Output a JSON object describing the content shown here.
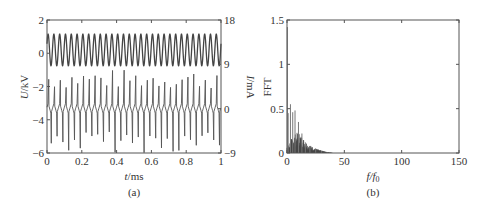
{
  "chart_data": [
    {
      "id": "a",
      "type": "line",
      "caption": "(a)",
      "title": "",
      "xlabel": "t/ms",
      "xlabel_italic": "t",
      "xlabel_unit": "/ms",
      "ylabel_left": "U/kV",
      "ylabel_left_italic": "U",
      "ylabel_left_unit": "/kV",
      "ylabel_right": "I/mA",
      "ylabel_right_italic": "I",
      "ylabel_right_unit": "/mA",
      "xlim": [
        0,
        1
      ],
      "ylim_left": [
        -6,
        2
      ],
      "ylim_right": [
        -9,
        18
      ],
      "xticks": [
        0,
        0.2,
        0.4,
        0.6,
        0.8,
        1
      ],
      "xtick_labels": [
        "0",
        "0.2",
        "0.4",
        "0.6",
        "0.8",
        "1"
      ],
      "yticks_left": [
        -6,
        -4,
        -2,
        0,
        2
      ],
      "ytick_labels_left": [
        "−6",
        "−4",
        "−2",
        "0",
        "2"
      ],
      "yticks_right": [
        -9,
        0,
        9,
        18
      ],
      "ytick_labels_right": [
        "−9",
        "0",
        "9",
        "18"
      ],
      "grid": false,
      "legend": null,
      "series": [
        {
          "name": "Voltage U",
          "axis": "left",
          "kind": "sinusoid",
          "offset_kV": 0.2,
          "amplitude_kV": 0.95,
          "cycles": 30,
          "color": "#444444"
        },
        {
          "name": "Current I",
          "axis": "right",
          "kind": "pulse-train",
          "baseline_mA": 0,
          "ripple_mA": 1.0,
          "pulses_per_cycle": 1,
          "cycles": 30,
          "positive_peak_mA_range": [
            4,
            8
          ],
          "negative_peak_mA_range": [
            -4.5,
            -9
          ],
          "color": "#555555"
        }
      ]
    },
    {
      "id": "b",
      "type": "bar",
      "caption": "(b)",
      "title": "",
      "xlabel": "f/f0",
      "xlabel_italic": "f/f",
      "xlabel_sub": "0",
      "ylabel": "FFT",
      "xlim": [
        0,
        150
      ],
      "ylim": [
        0,
        1.5
      ],
      "xticks": [
        0,
        50,
        100,
        150
      ],
      "xtick_labels": [
        "0",
        "50",
        "100",
        "150"
      ],
      "yticks": [
        0,
        0.5,
        1,
        1.5
      ],
      "ytick_labels": [
        "0",
        "0.5",
        "1",
        "1.5"
      ],
      "grid": false,
      "legend": null,
      "dominant_peaks": [
        {
          "x": 0.3,
          "y": 1.42
        },
        {
          "x": 1,
          "y": 0.45
        },
        {
          "x": 3,
          "y": 0.55
        },
        {
          "x": 5,
          "y": 0.46
        },
        {
          "x": 7,
          "y": 0.48
        },
        {
          "x": 10,
          "y": 0.35
        },
        {
          "x": 13,
          "y": 0.22
        },
        {
          "x": 16,
          "y": 0.12
        },
        {
          "x": 20,
          "y": 0.08
        },
        {
          "x": 25,
          "y": 0.04
        },
        {
          "x": 30,
          "y": 0.02
        },
        {
          "x": 35,
          "y": 0.01
        }
      ],
      "envelope": {
        "description": "dense harmonic cluster decaying from ~0.2 at f/f0≈5-12 to ~0 by f/f0≈40",
        "points": [
          [
            0,
            0.05
          ],
          [
            3,
            0.12
          ],
          [
            6,
            0.17
          ],
          [
            10,
            0.2
          ],
          [
            14,
            0.14
          ],
          [
            18,
            0.09
          ],
          [
            22,
            0.06
          ],
          [
            28,
            0.03
          ],
          [
            35,
            0.01
          ],
          [
            40,
            0.0
          ]
        ]
      },
      "color": "#444444"
    }
  ]
}
